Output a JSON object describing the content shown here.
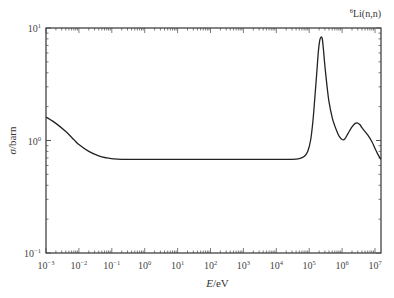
{
  "chart_data": {
    "type": "line",
    "title": "",
    "annotation": "6Li(n,n)",
    "annotation_parts": {
      "sup": "6",
      "text": "Li(n,n)"
    },
    "xlabel": "E/eV",
    "xlabel_parts": {
      "italic": "E",
      "rest": "/eV"
    },
    "ylabel": "σ/barn",
    "ylabel_parts": {
      "italic": "σ",
      "rest": "/barn"
    },
    "xscale": "log",
    "yscale": "log",
    "xlim": [
      0.001,
      20000000
    ],
    "ylim": [
      0.1,
      10
    ],
    "grid": false,
    "legend": "none",
    "x_ticks": [
      {
        "base": "10",
        "exp": "−3",
        "value": -3
      },
      {
        "base": "10",
        "exp": "−2",
        "value": -2
      },
      {
        "base": "10",
        "exp": "−1",
        "value": -1
      },
      {
        "base": "10",
        "exp": "0",
        "value": 0
      },
      {
        "base": "10",
        "exp": "1",
        "value": 1
      },
      {
        "base": "10",
        "exp": "2",
        "value": 2
      },
      {
        "base": "10",
        "exp": "3",
        "value": 3
      },
      {
        "base": "10",
        "exp": "4",
        "value": 4
      },
      {
        "base": "10",
        "exp": "5",
        "value": 5
      },
      {
        "base": "10",
        "exp": "6",
        "value": 6
      },
      {
        "base": "10",
        "exp": "7",
        "value": 7
      }
    ],
    "y_ticks": [
      {
        "base": "10",
        "exp": "−1",
        "value": -1
      },
      {
        "base": "10",
        "exp": "0",
        "value": 0
      },
      {
        "base": "10",
        "exp": "1",
        "value": 1
      }
    ],
    "series": [
      {
        "name": "6Li(n,n) elastic cross section",
        "color": "#222222",
        "x": [
          0.001,
          0.002,
          0.004,
          0.007,
          0.01,
          0.02,
          0.04,
          0.07,
          0.1,
          0.2,
          1,
          10,
          100,
          1000,
          10000,
          30000,
          50000,
          70000,
          90000,
          110000,
          130000,
          150000,
          170000,
          190000,
          210000,
          230000,
          250000,
          270000,
          300000,
          350000,
          400000,
          500000,
          600000,
          700000,
          800000,
          1000000,
          1200000,
          1500000,
          2000000,
          2500000,
          3000000,
          3500000,
          4000000,
          5000000,
          6000000,
          8000000,
          10000000,
          12000000,
          15000000
        ],
        "y": [
          1.62,
          1.42,
          1.2,
          1.02,
          0.92,
          0.8,
          0.73,
          0.7,
          0.69,
          0.68,
          0.68,
          0.68,
          0.68,
          0.68,
          0.68,
          0.68,
          0.69,
          0.72,
          0.8,
          1.0,
          1.5,
          2.5,
          4.0,
          6.2,
          7.8,
          8.3,
          8.0,
          6.5,
          4.6,
          3.0,
          2.2,
          1.6,
          1.35,
          1.2,
          1.1,
          1.02,
          1.03,
          1.15,
          1.32,
          1.42,
          1.43,
          1.38,
          1.3,
          1.2,
          1.12,
          0.98,
          0.85,
          0.76,
          0.68
        ]
      }
    ]
  }
}
